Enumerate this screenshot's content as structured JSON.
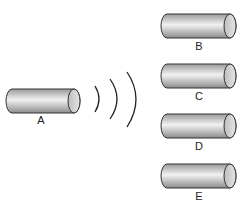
{
  "diagram": {
    "source": {
      "label": "A"
    },
    "waves": {
      "count": 3
    },
    "targets": [
      {
        "label": "B"
      },
      {
        "label": "C"
      },
      {
        "label": "D"
      },
      {
        "label": "E"
      }
    ],
    "colors": {
      "stroke": "#333333",
      "body_light": "#f2f2f2",
      "body_dark": "#9a9a9a",
      "end_inner": "#d8d8d8"
    }
  }
}
